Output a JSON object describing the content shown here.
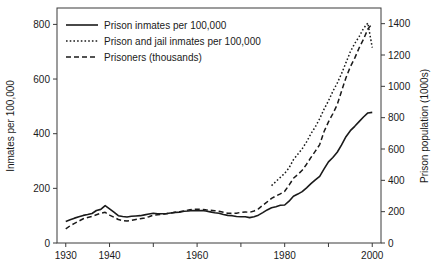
{
  "chart_data": {
    "type": "line",
    "title": "",
    "xlabel": "",
    "ylabel": "Inmates per 100,000",
    "y2label": "Prison population (1000s)",
    "xlim": [
      1928,
      2002
    ],
    "ylim": [
      0,
      860
    ],
    "y2lim": [
      0,
      1500
    ],
    "grid": false,
    "legend_position": "top-left",
    "xticks": [
      1930,
      1940,
      1950,
      1960,
      1970,
      1980,
      1990,
      2000
    ],
    "xtick_labels": [
      "1930",
      "1940",
      "",
      "1960",
      "",
      "1980",
      "",
      "2000"
    ],
    "yticks": [
      0,
      200,
      400,
      600,
      800
    ],
    "ytick_labels": [
      "0",
      "200",
      "400",
      "600",
      "800"
    ],
    "y2ticks": [
      0,
      200,
      400,
      600,
      800,
      1000,
      1200,
      1400
    ],
    "y2tick_labels": [
      "0",
      "200",
      "400",
      "600",
      "800",
      "1000",
      "1200",
      "1400"
    ],
    "x": [
      1930,
      1931,
      1932,
      1933,
      1934,
      1935,
      1936,
      1937,
      1938,
      1939,
      1940,
      1941,
      1942,
      1943,
      1944,
      1945,
      1946,
      1947,
      1948,
      1949,
      1950,
      1951,
      1952,
      1953,
      1954,
      1955,
      1956,
      1957,
      1958,
      1959,
      1960,
      1961,
      1962,
      1963,
      1964,
      1965,
      1966,
      1967,
      1968,
      1969,
      1970,
      1971,
      1972,
      1973,
      1974,
      1975,
      1976,
      1977,
      1978,
      1979,
      1980,
      1981,
      1982,
      1983,
      1984,
      1985,
      1986,
      1987,
      1988,
      1989,
      1990,
      1991,
      1992,
      1993,
      1994,
      1995,
      1996,
      1997,
      1998,
      1999,
      2000
    ],
    "series": [
      {
        "name": "Prison inmates per 100,000",
        "style": "solid",
        "axis": "left",
        "unit": "inmates per 100,000",
        "values": [
          79,
          85,
          91,
          96,
          101,
          104,
          108,
          119,
          123,
          137,
          125,
          113,
          100,
          97,
          95,
          98,
          99,
          100,
          103,
          106,
          109,
          107,
          107,
          108,
          110,
          112,
          113,
          116,
          117,
          119,
          118,
          119,
          117,
          114,
          111,
          109,
          104,
          101,
          100,
          97,
          96,
          96,
          93,
          96,
          102,
          111,
          121,
          129,
          133,
          138,
          139,
          153,
          171,
          179,
          188,
          202,
          217,
          231,
          244,
          271,
          297,
          313,
          332,
          359,
          389,
          411,
          427,
          444,
          461,
          476,
          478
        ]
      },
      {
        "name": "Prison and jail inmates per 100,000",
        "style": "dotted",
        "axis": "left",
        "unit": "inmates per 100,000",
        "values": [
          null,
          null,
          null,
          null,
          null,
          null,
          null,
          null,
          null,
          null,
          null,
          null,
          null,
          null,
          null,
          null,
          null,
          null,
          null,
          null,
          null,
          null,
          null,
          null,
          null,
          null,
          null,
          null,
          null,
          null,
          null,
          null,
          null,
          null,
          null,
          null,
          null,
          null,
          null,
          null,
          null,
          null,
          null,
          null,
          null,
          null,
          null,
          210,
          225,
          240,
          255,
          275,
          305,
          325,
          345,
          370,
          400,
          425,
          455,
          490,
          520,
          555,
          585,
          620,
          660,
          700,
          730,
          755,
          785,
          805,
          715
        ]
      },
      {
        "name": "Prisoners (thousands)",
        "style": "dashed",
        "axis": "right",
        "unit": "thousands of prisoners",
        "values": [
          90,
          110,
          125,
          140,
          155,
          163,
          170,
          180,
          190,
          196,
          178,
          165,
          150,
          143,
          140,
          145,
          150,
          155,
          160,
          168,
          178,
          180,
          182,
          186,
          191,
          196,
          200,
          205,
          210,
          216,
          216,
          215,
          212,
          210,
          206,
          202,
          196,
          190,
          190,
          190,
          196,
          198,
          196,
          204,
          218,
          241,
          262,
          285,
          300,
          314,
          330,
          369,
          413,
          437,
          464,
          503,
          546,
          586,
          628,
          712,
          773,
          825,
          883,
          970,
          1055,
          1125,
          1180,
          1245,
          1300,
          1366,
          1400
        ]
      }
    ]
  },
  "legend": {
    "items": [
      {
        "label": "Prison inmates per 100,000",
        "style": "solid"
      },
      {
        "label": "Prison and jail inmates per 100,000",
        "style": "dotted"
      },
      {
        "label": "Prisoners (thousands)",
        "style": "dashed"
      }
    ]
  }
}
